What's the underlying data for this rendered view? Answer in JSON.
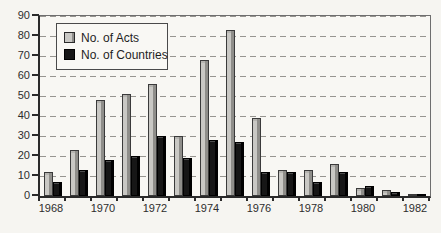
{
  "figure": {
    "background_color": "#f6f5f1",
    "plot_border_color": "#2a2a2a",
    "gridline_color": "#979590"
  },
  "chart_data": {
    "type": "bar",
    "title": "",
    "xlabel": "",
    "ylabel": "",
    "categories": [
      "1968",
      "1969",
      "1970",
      "1971",
      "1972",
      "1973",
      "1974",
      "1975",
      "1976",
      "1977",
      "1978",
      "1979",
      "1980",
      "1981",
      "1982"
    ],
    "series": [
      {
        "name": "No. of Acts",
        "color": "#c9c8c4",
        "values": [
          12,
          23,
          48,
          51,
          56,
          30,
          68,
          83,
          39,
          13,
          13,
          16,
          4,
          3,
          1
        ]
      },
      {
        "name": "No. of Countries",
        "color": "#161616",
        "values": [
          7,
          13,
          18,
          20,
          30,
          19,
          28,
          27,
          12,
          12,
          7,
          12,
          5,
          2,
          1
        ]
      }
    ],
    "ylim": [
      0,
      90
    ],
    "yticks": [
      0,
      10,
      20,
      30,
      40,
      50,
      60,
      70,
      80,
      90
    ],
    "xtick_labels": [
      "1968",
      "1970",
      "1972",
      "1974",
      "1976",
      "1978",
      "1980",
      "1982"
    ],
    "grid": "horizontal-dashed",
    "legend_position": "top-left-inside"
  }
}
